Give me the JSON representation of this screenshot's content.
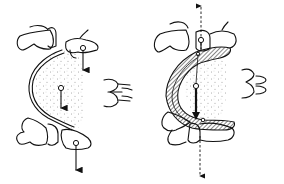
{
  "figure": {
    "colors": {
      "ink": "#111111",
      "background": "#ffffff",
      "stipple": "#555555"
    },
    "panels": [
      {
        "id": "left",
        "label": "",
        "elements": [
          "upper-abutment-teeth",
          "lower-abutment-teeth",
          "thin-connector-bar",
          "stippled-edentulous-ridge",
          "force-arrow-upper",
          "force-arrow-center",
          "force-arrow-lower",
          "side-occlusion-glyph"
        ]
      },
      {
        "id": "right",
        "label": "",
        "elements": [
          "upper-abutment-teeth",
          "lower-abutment-teeth",
          "hatched-major-connector",
          "stippled-edentulous-ridge",
          "dashed-axis-up",
          "dashed-axis-down",
          "center-force-arrow",
          "side-occlusion-glyph"
        ]
      }
    ]
  }
}
